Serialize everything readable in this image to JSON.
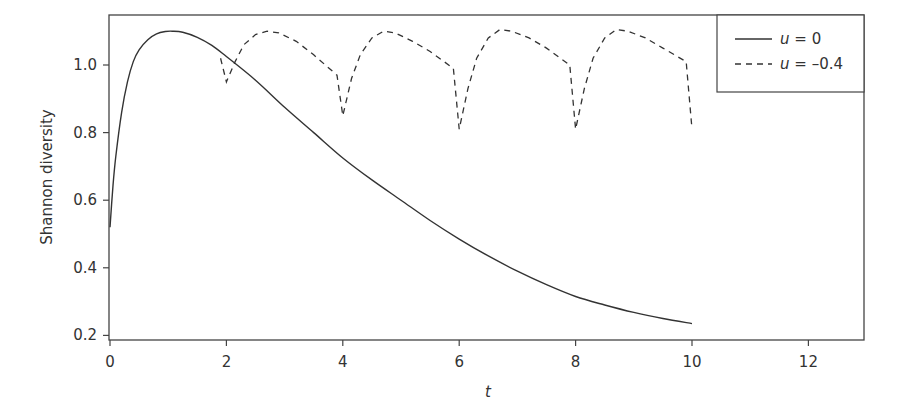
{
  "chart_data": {
    "type": "line",
    "title": "",
    "xlabel": "t",
    "ylabel": "Shannon diversity",
    "xlim": [
      0,
      13
    ],
    "ylim": [
      0.19,
      1.14
    ],
    "x_ticks": [
      0,
      2,
      4,
      6,
      8,
      10,
      12
    ],
    "x_tick_labels": [
      "0",
      "2",
      "4",
      "6",
      "8",
      "10",
      "12"
    ],
    "y_ticks": [
      0.2,
      0.4,
      0.6,
      0.8,
      1.0
    ],
    "y_tick_labels": [
      "0.2",
      "0.4",
      "0.6",
      "0.8",
      "1.0"
    ],
    "grid": false,
    "legend_position": "upper right",
    "series": [
      {
        "name": "u = 0",
        "legend_var": "u",
        "legend_value": "0",
        "style": "solid",
        "color": "#333333",
        "x": [
          0,
          0.05,
          0.1,
          0.2,
          0.3,
          0.4,
          0.5,
          0.65,
          0.8,
          0.95,
          1.07,
          1.25,
          1.5,
          1.75,
          2.0,
          2.5,
          3.0,
          3.5,
          4.0,
          4.5,
          5.0,
          5.5,
          6.0,
          6.5,
          7.0,
          7.5,
          8.0,
          8.5,
          9.0,
          9.5,
          10.0
        ],
        "y": [
          0.52,
          0.64,
          0.73,
          0.86,
          0.95,
          1.01,
          1.045,
          1.075,
          1.092,
          1.099,
          1.1,
          1.097,
          1.082,
          1.058,
          1.025,
          0.955,
          0.875,
          0.8,
          0.725,
          0.66,
          0.6,
          0.54,
          0.485,
          0.435,
          0.39,
          0.35,
          0.315,
          0.29,
          0.268,
          0.25,
          0.235
        ]
      },
      {
        "name": "u = -0.4",
        "legend_var": "u",
        "legend_value": "–0.4",
        "style": "dashed",
        "color": "#333333",
        "x": [
          1.9,
          2.0,
          2.15,
          2.3,
          2.5,
          2.7,
          2.9,
          3.2,
          3.5,
          3.9,
          4.0,
          4.15,
          4.3,
          4.5,
          4.7,
          4.9,
          5.2,
          5.5,
          5.9,
          6.0,
          6.15,
          6.3,
          6.5,
          6.7,
          6.9,
          7.2,
          7.5,
          7.9,
          8.0,
          8.15,
          8.3,
          8.5,
          8.7,
          8.9,
          9.2,
          9.5,
          9.9,
          10.0
        ],
        "y": [
          1.02,
          0.95,
          1.01,
          1.06,
          1.09,
          1.1,
          1.095,
          1.07,
          1.03,
          0.97,
          0.85,
          0.96,
          1.03,
          1.08,
          1.1,
          1.095,
          1.07,
          1.04,
          0.99,
          0.81,
          0.93,
          1.02,
          1.08,
          1.105,
          1.1,
          1.08,
          1.05,
          1.0,
          0.81,
          0.93,
          1.02,
          1.08,
          1.105,
          1.1,
          1.08,
          1.05,
          1.01,
          0.81
        ]
      }
    ]
  }
}
